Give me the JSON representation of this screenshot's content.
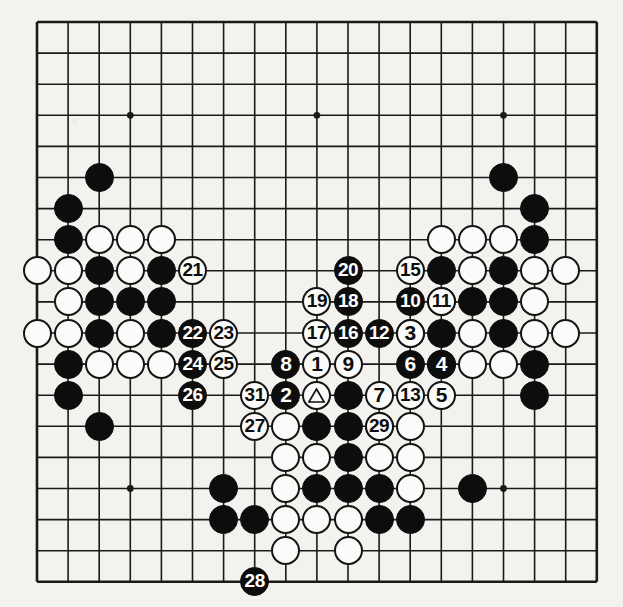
{
  "diagram": {
    "type": "go-board-diagram",
    "board_size": 19,
    "background_color": "#f4f2ee",
    "line_color": "#1a1a1a",
    "black_stone_color": "#0d0d0d",
    "white_stone_color": "#fbfbf9",
    "star_points": [
      [
        4,
        4
      ],
      [
        10,
        4
      ],
      [
        16,
        4
      ],
      [
        4,
        10
      ],
      [
        10,
        10
      ],
      [
        16,
        10
      ],
      [
        4,
        16
      ],
      [
        10,
        16
      ],
      [
        16,
        16
      ]
    ],
    "geometry": {
      "origin_x": 37,
      "origin_y": 22,
      "spacing": 31.1,
      "stone_diameter": 29
    },
    "marks": {
      "triangle_label": "triangle",
      "triangle_stone": {
        "col": 10,
        "row": 13,
        "color": "white"
      }
    },
    "plain_stones": [
      {
        "col": 3,
        "row": 6,
        "color": "black"
      },
      {
        "col": 2,
        "row": 7,
        "color": "black"
      },
      {
        "col": 2,
        "row": 8,
        "color": "black"
      },
      {
        "col": 3,
        "row": 8,
        "color": "white"
      },
      {
        "col": 4,
        "row": 8,
        "color": "white"
      },
      {
        "col": 5,
        "row": 8,
        "color": "white"
      },
      {
        "col": 1,
        "row": 9,
        "color": "white"
      },
      {
        "col": 2,
        "row": 9,
        "color": "white"
      },
      {
        "col": 3,
        "row": 9,
        "color": "black"
      },
      {
        "col": 4,
        "row": 9,
        "color": "white"
      },
      {
        "col": 5,
        "row": 9,
        "color": "black"
      },
      {
        "col": 2,
        "row": 10,
        "color": "white"
      },
      {
        "col": 3,
        "row": 10,
        "color": "black"
      },
      {
        "col": 4,
        "row": 10,
        "color": "black"
      },
      {
        "col": 5,
        "row": 10,
        "color": "black"
      },
      {
        "col": 1,
        "row": 11,
        "color": "white"
      },
      {
        "col": 2,
        "row": 11,
        "color": "white"
      },
      {
        "col": 3,
        "row": 11,
        "color": "black"
      },
      {
        "col": 4,
        "row": 11,
        "color": "white"
      },
      {
        "col": 5,
        "row": 11,
        "color": "black"
      },
      {
        "col": 2,
        "row": 12,
        "color": "black"
      },
      {
        "col": 3,
        "row": 12,
        "color": "white"
      },
      {
        "col": 4,
        "row": 12,
        "color": "white"
      },
      {
        "col": 5,
        "row": 12,
        "color": "white"
      },
      {
        "col": 2,
        "row": 13,
        "color": "black"
      },
      {
        "col": 3,
        "row": 14,
        "color": "black"
      },
      {
        "col": 11,
        "row": 13,
        "color": "black"
      },
      {
        "col": 16,
        "row": 6,
        "color": "black"
      },
      {
        "col": 17,
        "row": 7,
        "color": "black"
      },
      {
        "col": 17,
        "row": 8,
        "color": "black"
      },
      {
        "col": 14,
        "row": 8,
        "color": "white"
      },
      {
        "col": 15,
        "row": 8,
        "color": "white"
      },
      {
        "col": 16,
        "row": 8,
        "color": "white"
      },
      {
        "col": 14,
        "row": 9,
        "color": "black"
      },
      {
        "col": 15,
        "row": 9,
        "color": "white"
      },
      {
        "col": 16,
        "row": 9,
        "color": "black"
      },
      {
        "col": 17,
        "row": 9,
        "color": "white"
      },
      {
        "col": 18,
        "row": 9,
        "color": "white"
      },
      {
        "col": 14,
        "row": 10,
        "color": "black"
      },
      {
        "col": 15,
        "row": 10,
        "color": "black"
      },
      {
        "col": 16,
        "row": 10,
        "color": "black"
      },
      {
        "col": 17,
        "row": 10,
        "color": "white"
      },
      {
        "col": 13,
        "row": 11,
        "color": "black"
      },
      {
        "col": 14,
        "row": 11,
        "color": "black"
      },
      {
        "col": 15,
        "row": 11,
        "color": "white"
      },
      {
        "col": 16,
        "row": 11,
        "color": "black"
      },
      {
        "col": 17,
        "row": 11,
        "color": "white"
      },
      {
        "col": 18,
        "row": 11,
        "color": "white"
      },
      {
        "col": 14,
        "row": 12,
        "color": "white"
      },
      {
        "col": 15,
        "row": 12,
        "color": "white"
      },
      {
        "col": 16,
        "row": 12,
        "color": "white"
      },
      {
        "col": 17,
        "row": 12,
        "color": "black"
      },
      {
        "col": 17,
        "row": 13,
        "color": "black"
      },
      {
        "col": 9,
        "row": 14,
        "color": "white"
      },
      {
        "col": 10,
        "row": 14,
        "color": "black"
      },
      {
        "col": 11,
        "row": 14,
        "color": "black"
      },
      {
        "col": 12,
        "row": 14,
        "color": "black"
      },
      {
        "col": 13,
        "row": 14,
        "color": "white"
      },
      {
        "col": 9,
        "row": 15,
        "color": "white"
      },
      {
        "col": 10,
        "row": 15,
        "color": "white"
      },
      {
        "col": 11,
        "row": 15,
        "color": "black"
      },
      {
        "col": 12,
        "row": 15,
        "color": "white"
      },
      {
        "col": 13,
        "row": 15,
        "color": "white"
      },
      {
        "col": 7,
        "row": 16,
        "color": "black"
      },
      {
        "col": 9,
        "row": 16,
        "color": "white"
      },
      {
        "col": 10,
        "row": 16,
        "color": "black"
      },
      {
        "col": 11,
        "row": 16,
        "color": "black"
      },
      {
        "col": 12,
        "row": 16,
        "color": "black"
      },
      {
        "col": 13,
        "row": 16,
        "color": "white"
      },
      {
        "col": 15,
        "row": 16,
        "color": "black"
      },
      {
        "col": 7,
        "row": 17,
        "color": "black"
      },
      {
        "col": 8,
        "row": 17,
        "color": "black"
      },
      {
        "col": 9,
        "row": 17,
        "color": "white"
      },
      {
        "col": 10,
        "row": 17,
        "color": "white"
      },
      {
        "col": 11,
        "row": 17,
        "color": "white"
      },
      {
        "col": 12,
        "row": 17,
        "color": "black"
      },
      {
        "col": 13,
        "row": 17,
        "color": "black"
      },
      {
        "col": 9,
        "row": 18,
        "color": "white"
      },
      {
        "col": 11,
        "row": 18,
        "color": "white"
      }
    ],
    "numbered_moves": [
      {
        "number": "1",
        "col": 10,
        "row": 12,
        "color": "white"
      },
      {
        "number": "2",
        "col": 9,
        "row": 13,
        "color": "black"
      },
      {
        "number": "3",
        "col": 13,
        "row": 11,
        "color": "white"
      },
      {
        "number": "4",
        "col": 14,
        "row": 12,
        "color": "black"
      },
      {
        "number": "5",
        "col": 14,
        "row": 13,
        "color": "white"
      },
      {
        "number": "6",
        "col": 13,
        "row": 12,
        "color": "black"
      },
      {
        "number": "7",
        "col": 12,
        "row": 13,
        "color": "white"
      },
      {
        "number": "8",
        "col": 9,
        "row": 12,
        "color": "black"
      },
      {
        "number": "9",
        "col": 11,
        "row": 12,
        "color": "white"
      },
      {
        "number": "10",
        "col": 13,
        "row": 10,
        "color": "black"
      },
      {
        "number": "11",
        "col": 14,
        "row": 10,
        "color": "white"
      },
      {
        "number": "12",
        "col": 12,
        "row": 11,
        "color": "black"
      },
      {
        "number": "13",
        "col": 13,
        "row": 13,
        "color": "white"
      },
      {
        "number": "14",
        "col": 0,
        "row": 0,
        "color": "white"
      },
      {
        "number": "15",
        "col": 13,
        "row": 9,
        "color": "white"
      },
      {
        "number": "16",
        "col": 11,
        "row": 11,
        "color": "black"
      },
      {
        "number": "17",
        "col": 10,
        "row": 11,
        "color": "white"
      },
      {
        "number": "18",
        "col": 11,
        "row": 10,
        "color": "black"
      },
      {
        "number": "19",
        "col": 10,
        "row": 10,
        "color": "white"
      },
      {
        "number": "20",
        "col": 11,
        "row": 9,
        "color": "black"
      },
      {
        "number": "21",
        "col": 6,
        "row": 9,
        "color": "white"
      },
      {
        "number": "22",
        "col": 6,
        "row": 11,
        "color": "black"
      },
      {
        "number": "23",
        "col": 7,
        "row": 11,
        "color": "white"
      },
      {
        "number": "24",
        "col": 6,
        "row": 12,
        "color": "black"
      },
      {
        "number": "25",
        "col": 7,
        "row": 12,
        "color": "white"
      },
      {
        "number": "26",
        "col": 6,
        "row": 13,
        "color": "black"
      },
      {
        "number": "27",
        "col": 8,
        "row": 14,
        "color": "white"
      },
      {
        "number": "28",
        "col": 8,
        "row": 19,
        "color": "black"
      },
      {
        "number": "29",
        "col": 12,
        "row": 14,
        "color": "white"
      },
      {
        "number": "31",
        "col": 8,
        "row": 13,
        "color": "white"
      }
    ],
    "excluded_numbers": [
      "14",
      "30"
    ]
  }
}
